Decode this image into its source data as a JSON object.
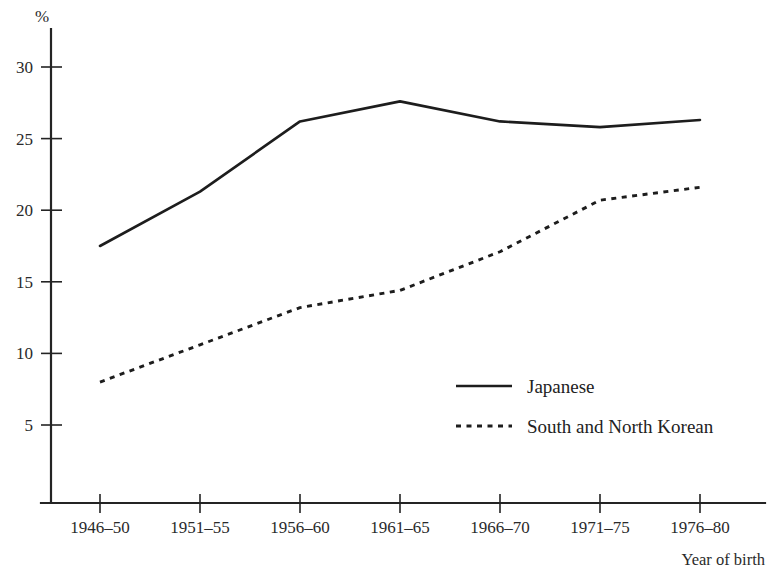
{
  "chart_data": {
    "type": "line",
    "title": "",
    "subtitle": "",
    "xlabel": "Year of birth",
    "ylabel": "%",
    "categories": [
      "1946–50",
      "1951–55",
      "1956–60",
      "1961–65",
      "1966–70",
      "1971–75",
      "1976–80"
    ],
    "series": [
      {
        "name": "Japanese",
        "style": "solid",
        "values": [
          17.5,
          21.3,
          26.2,
          27.6,
          26.2,
          25.8,
          26.3
        ]
      },
      {
        "name": "South and North Korean",
        "style": "dashed",
        "values": [
          8.0,
          10.6,
          13.2,
          14.4,
          17.1,
          20.7,
          21.6
        ]
      }
    ],
    "ylim": [
      0,
      32
    ],
    "yticks": [
      5,
      10,
      15,
      20,
      25,
      30
    ],
    "ytick_labels": [
      "5",
      "10",
      "15",
      "20",
      "25",
      "30"
    ],
    "grid": false,
    "legend_position": "inside-right-lower"
  },
  "axis": {
    "y_unit_label": "%",
    "x_axis_title": "Year of birth"
  },
  "legend": {
    "entries": [
      {
        "label": "Japanese",
        "style": "solid"
      },
      {
        "label": "South and North Korean",
        "style": "dashed"
      }
    ]
  },
  "colors": {
    "line": "#1d1d1d",
    "axis": "#242424",
    "text": "#2a2a2a",
    "background": "#ffffff"
  }
}
